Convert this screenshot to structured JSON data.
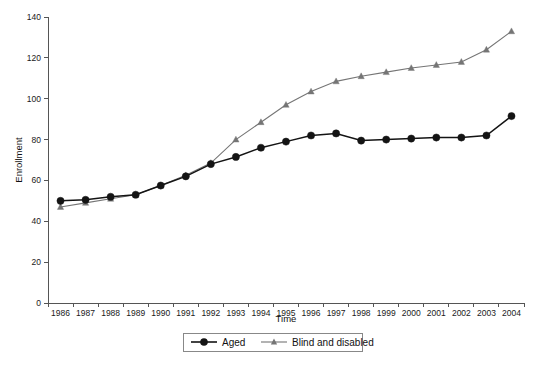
{
  "chart_data": {
    "type": "line",
    "title": "",
    "xlabel": "Time",
    "ylabel": "Enrollment",
    "categories": [
      "1986",
      "1987",
      "1988",
      "1989",
      "1990",
      "1991",
      "1992",
      "1993",
      "1994",
      "1995",
      "1996",
      "1997",
      "1998",
      "1999",
      "2000",
      "2001",
      "2002",
      "2003",
      "2004"
    ],
    "x": [
      1986,
      1987,
      1988,
      1989,
      1990,
      1991,
      1992,
      1993,
      1994,
      1995,
      1996,
      1997,
      1998,
      1999,
      2000,
      2001,
      2002,
      2003,
      2004
    ],
    "ylim": [
      0,
      140
    ],
    "yticks": [
      0,
      20,
      40,
      60,
      80,
      100,
      120,
      140
    ],
    "ytick_labels": [
      "0",
      "20",
      "40",
      "60",
      "80",
      "100",
      "120",
      "140"
    ],
    "grid": false,
    "legend_position": "bottom-center",
    "series": [
      {
        "name": "Aged",
        "color": "#141414",
        "marker": "circle",
        "values": [
          50.0,
          50.5,
          52.0,
          53.0,
          57.5,
          62.0,
          68.0,
          71.5,
          76.0,
          79.0,
          82.0,
          83.0,
          79.5,
          80.0,
          80.5,
          81.0,
          81.0,
          82.0,
          91.5
        ]
      },
      {
        "name": "Blind and disabled",
        "color": "#757575",
        "marker": "triangle",
        "values": [
          47.0,
          49.0,
          51.0,
          53.0,
          57.5,
          62.5,
          68.5,
          80.0,
          88.5,
          97.0,
          103.5,
          108.5,
          111.0,
          113.0,
          115.0,
          116.5,
          118.0,
          124.0,
          133.0
        ]
      }
    ]
  },
  "axes": {
    "y_title": "Enrollment",
    "x_title": "Time"
  },
  "legend": {
    "entries": [
      {
        "label": "Aged",
        "marker": "circle-marker",
        "color": "#141414"
      },
      {
        "label": "Blind and disabled",
        "marker": "triangle-marker",
        "color": "#757575"
      }
    ]
  }
}
